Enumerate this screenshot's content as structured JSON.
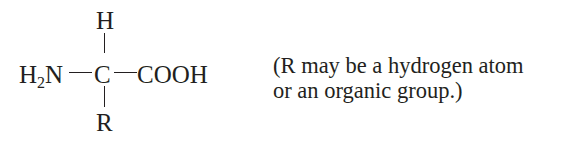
{
  "diagram": {
    "structure": {
      "amino_group": {
        "main": "H",
        "subscript": "2",
        "tail": "N"
      },
      "alpha_carbon": "C",
      "top_substituent": "H",
      "bottom_substituent": "R",
      "carboxyl_group": "COOH"
    },
    "caption": {
      "line1": "(R may be a hydrogen atom",
      "line2": "or an organic group.)"
    }
  }
}
